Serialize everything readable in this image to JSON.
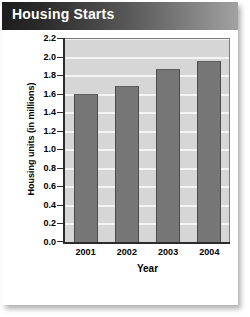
{
  "card": {
    "title": "Housing Starts"
  },
  "chart_data": {
    "type": "bar",
    "title": "Housing Starts",
    "categories": [
      "2001",
      "2002",
      "2003",
      "2004"
    ],
    "values": [
      1.6,
      1.68,
      1.87,
      1.95
    ],
    "xlabel": "Year",
    "ylabel": "Housing units (in millions)",
    "ylim": [
      0.0,
      2.2
    ],
    "ytick_step": 0.2,
    "yticks": [
      "2.2",
      "2.0",
      "1.8",
      "1.6",
      "1.4",
      "1.2",
      "1.0",
      "0.8",
      "0.6",
      "0.4",
      "0.2",
      "0.0"
    ],
    "grid": true,
    "legend": null,
    "colors": {
      "bar": "#767676",
      "bar_edge": "#4a4a4a",
      "plot_background": "#d6d6d6",
      "gridline": "#f4f4f4",
      "axis": "#2b2b2b",
      "title_text": "#ffffff",
      "card_background": "#ffffff"
    }
  }
}
